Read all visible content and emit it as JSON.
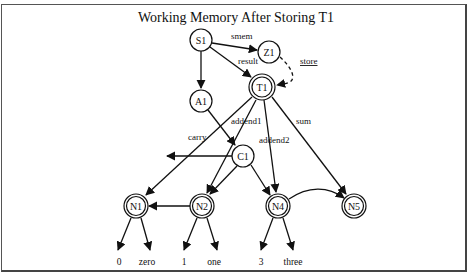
{
  "title": "Working Memory After Storing T1",
  "nodes": {
    "S1": {
      "label": "S1",
      "x": 201,
      "y": 40,
      "double": false
    },
    "Z1": {
      "label": "Z1",
      "x": 269,
      "y": 52,
      "double": false
    },
    "T1": {
      "label": "T1",
      "x": 262,
      "y": 87,
      "double": true
    },
    "A1": {
      "label": "A1",
      "x": 201,
      "y": 101,
      "double": false
    },
    "C1": {
      "label": "C1",
      "x": 243,
      "y": 156,
      "double": false
    },
    "N1": {
      "label": "N1",
      "x": 136,
      "y": 206,
      "double": true
    },
    "N2": {
      "label": "N2",
      "x": 202,
      "y": 206,
      "double": true
    },
    "N4": {
      "label": "N4",
      "x": 278,
      "y": 206,
      "double": true
    },
    "N5": {
      "label": "N5",
      "x": 354,
      "y": 206,
      "double": true
    }
  },
  "edge_labels": {
    "smem": "smem",
    "result": "result",
    "store": "store",
    "addend1": "addend1",
    "addend2": "addend2",
    "sum": "sum",
    "carry": "carry"
  },
  "leaves": {
    "n1_value": "0",
    "n1_name": "zero",
    "n2_value": "1",
    "n2_name": "one",
    "n4_value": "3",
    "n4_name": "three"
  },
  "edges": [
    {
      "from": "S1",
      "to": "Z1",
      "label": "smem"
    },
    {
      "from": "S1",
      "to": "T1",
      "label": "result"
    },
    {
      "from": "S1",
      "to": "A1",
      "label": ""
    },
    {
      "from": "Z1",
      "to": "T1",
      "label": "store",
      "style": "dashed"
    },
    {
      "from": "A1",
      "to": "C1",
      "label": ""
    },
    {
      "from": "T1",
      "to": "N1",
      "label": "carry"
    },
    {
      "from": "T1",
      "to": "N2",
      "label": "addend1"
    },
    {
      "from": "T1",
      "to": "N4",
      "label": "addend2"
    },
    {
      "from": "T1",
      "to": "N5",
      "label": "sum"
    },
    {
      "from": "C1",
      "to": "(left)",
      "label": ""
    },
    {
      "from": "C1",
      "to": "N2",
      "label": ""
    },
    {
      "from": "C1",
      "to": "N4",
      "label": ""
    },
    {
      "from": "N2",
      "to": "N1",
      "label": ""
    },
    {
      "from": "N4",
      "to": "N5",
      "label": ""
    },
    {
      "from": "N1",
      "to": "0",
      "label": ""
    },
    {
      "from": "N1",
      "to": "zero",
      "label": ""
    },
    {
      "from": "N2",
      "to": "1",
      "label": ""
    },
    {
      "from": "N2",
      "to": "one",
      "label": ""
    },
    {
      "from": "N4",
      "to": "3",
      "label": ""
    },
    {
      "from": "N4",
      "to": "three",
      "label": ""
    }
  ]
}
